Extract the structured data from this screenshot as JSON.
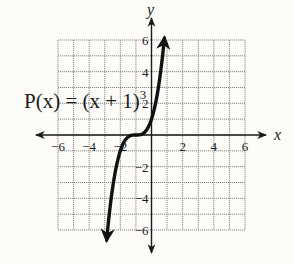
{
  "chart_data": {
    "type": "line",
    "title": "",
    "function_label": "P(x) = (x + 1)",
    "function_exponent": "3",
    "xlabel": "x",
    "ylabel": "y",
    "xlim": [
      -6,
      6
    ],
    "ylim": [
      -6,
      6
    ],
    "grid": true,
    "grid_step": 1,
    "x_ticks": [
      {
        "value": -6,
        "label": "−6"
      },
      {
        "value": -4,
        "label": "−4"
      },
      {
        "value": -2,
        "label": "−2"
      },
      {
        "value": 2,
        "label": "2"
      },
      {
        "value": 4,
        "label": "4"
      },
      {
        "value": 6,
        "label": "6"
      }
    ],
    "y_ticks": [
      {
        "value": 6,
        "label": "6"
      },
      {
        "value": 4,
        "label": "4"
      },
      {
        "value": 2,
        "label": "2"
      },
      {
        "value": -2,
        "label": "−2"
      },
      {
        "value": -4,
        "label": "−4"
      },
      {
        "value": -6,
        "label": "−6"
      }
    ],
    "series": [
      {
        "name": "P(x) = (x + 1)^3",
        "x_range": [
          -2.88,
          0.83
        ],
        "points": [
          [
            -2.88,
            -6.6
          ],
          [
            -2.6,
            -4.1
          ],
          [
            -2.4,
            -2.74
          ],
          [
            -2.2,
            -1.73
          ],
          [
            -2.0,
            -1.0
          ],
          [
            -1.8,
            -0.51
          ],
          [
            -1.6,
            -0.22
          ],
          [
            -1.4,
            -0.06
          ],
          [
            -1.2,
            -0.01
          ],
          [
            -1.0,
            0.0
          ],
          [
            -0.8,
            0.01
          ],
          [
            -0.6,
            0.06
          ],
          [
            -0.4,
            0.22
          ],
          [
            -0.2,
            0.51
          ],
          [
            0.0,
            1.0
          ],
          [
            0.2,
            1.73
          ],
          [
            0.4,
            2.74
          ],
          [
            0.6,
            4.1
          ],
          [
            0.83,
            6.13
          ]
        ],
        "arrows_at_ends": true
      }
    ],
    "colors": {
      "curve": "#111111",
      "axis": "#1a1a1a",
      "grid": "#8a8a8a",
      "background": "#fdfcf8"
    }
  }
}
